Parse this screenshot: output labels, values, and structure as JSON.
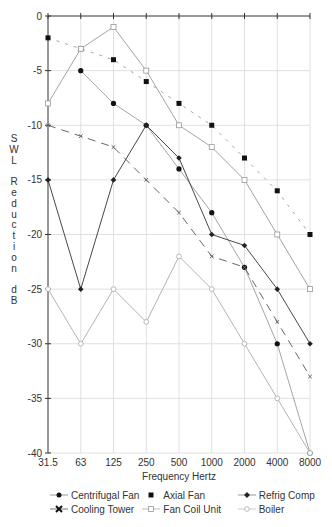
{
  "chart_data": {
    "type": "line",
    "title": "",
    "xlabel": "Frequency Hertz",
    "ylabel": "SWL Reduction dB",
    "categories": [
      "31.5",
      "63",
      "125",
      "250",
      "500",
      "1000",
      "2000",
      "4000",
      "8000"
    ],
    "ylim": [
      -40,
      0
    ],
    "yticks": [
      0,
      -5,
      -10,
      -15,
      -20,
      -25,
      -30,
      -35,
      -40
    ],
    "ytick_labels": [
      "0",
      "-5",
      "-10",
      "-15",
      "-20",
      "-25",
      "-30",
      "-35",
      "-40"
    ],
    "grid": true,
    "legend_position": "bottom",
    "series": [
      {
        "name": "Centrifugal Fan",
        "marker": "circle",
        "color": "#111111",
        "dash": "none",
        "values": [
          null,
          -5,
          -8,
          -10,
          -14,
          -18,
          -23,
          -30,
          -40
        ]
      },
      {
        "name": "Axial Fan",
        "marker": "square",
        "color": "#111111",
        "dash": "3,6",
        "values": [
          -2,
          -3,
          -4,
          -6,
          -8,
          -10,
          -13,
          -16,
          -20
        ]
      },
      {
        "name": "Refrig Comp",
        "marker": "diamond",
        "color": "#333333",
        "dash": "none",
        "values": [
          -15,
          -25,
          -15,
          -10,
          -13,
          -20,
          -21,
          -25,
          -30
        ]
      },
      {
        "name": "Cooling Tower",
        "marker": "x",
        "color": "#555555",
        "dash": "8,6",
        "values": [
          -10,
          -11,
          -12,
          -15,
          -18,
          -22,
          -23,
          -28,
          -33
        ]
      },
      {
        "name": "Fan Coil Unit",
        "marker": "open-square",
        "color": "#999999",
        "dash": "none",
        "values": [
          -8,
          -3,
          -1,
          -5,
          -10,
          -12,
          -15,
          -20,
          -25
        ]
      },
      {
        "name": "Boiler",
        "marker": "open-circle",
        "color": "#aaaaaa",
        "dash": "none",
        "values": [
          -25,
          -30,
          -25,
          -28,
          -22,
          -25,
          -30,
          -35,
          -40
        ]
      }
    ]
  },
  "legend": {
    "items": [
      {
        "label": "Centrifugal Fan"
      },
      {
        "label": "Axial Fan"
      },
      {
        "label": "Refrig Comp"
      },
      {
        "label": "Cooling Tower"
      },
      {
        "label": "Fan Coil Unit"
      },
      {
        "label": "Boiler"
      }
    ]
  },
  "ylabel_chars": [
    "S",
    "W",
    "L",
    " ",
    "R",
    "e",
    "d",
    "u",
    "c",
    "t",
    "i",
    "o",
    "n",
    " ",
    "d",
    "B"
  ]
}
